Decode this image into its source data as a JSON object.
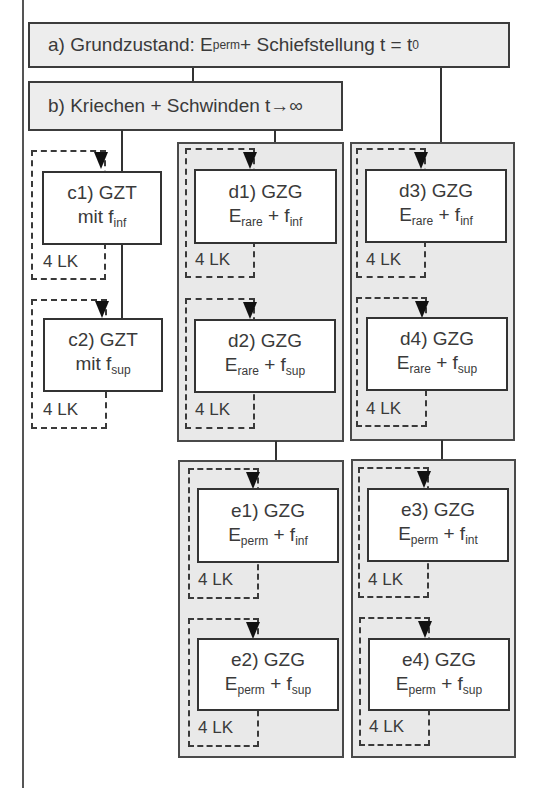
{
  "diagram": {
    "box_a": {
      "prefix": "a) Grundzustand: E",
      "sub1": "perm",
      "mid": " + Schiefstellung t = t",
      "sub2": "0"
    },
    "box_b": {
      "label": "b) Kriechen + Schwinden t→∞"
    },
    "loop_label": "4 LK",
    "nodes": {
      "c1": {
        "title": "c1) GZT",
        "line2_main": "mit f",
        "line2_sub": "inf"
      },
      "c2": {
        "title": "c2) GZT",
        "line2_main": "mit f",
        "line2_sub": "sup"
      },
      "d1": {
        "title": "d1) GZG",
        "e_sub": "rare",
        "f_sub": "inf"
      },
      "d2": {
        "title": "d2) GZG",
        "e_sub": "rare",
        "f_sub": "sup"
      },
      "d3": {
        "title": "d3) GZG",
        "e_sub": "rare",
        "f_sub": "inf"
      },
      "d4": {
        "title": "d4) GZG",
        "e_sub": "rare",
        "f_sub": "sup"
      },
      "e1": {
        "title": "e1) GZG",
        "e_sub": "perm",
        "f_sub": "inf"
      },
      "e2": {
        "title": "e2) GZG",
        "e_sub": "perm",
        "f_sub": "sup"
      },
      "e3": {
        "title": "e3) GZG",
        "e_sub": "perm",
        "f_sub": "int"
      },
      "e4": {
        "title": "e4) GZG",
        "e_sub": "perm",
        "f_sub": "sup"
      }
    },
    "symbols": {
      "E": "E",
      "plus": " + ",
      "f": "f"
    }
  }
}
